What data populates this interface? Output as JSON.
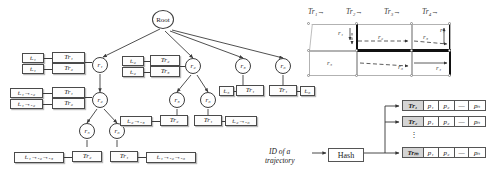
{
  "figure": {
    "panels": [
      "index-tree",
      "grid-trajectories",
      "hash-table"
    ]
  },
  "tree": {
    "root_label": "Root",
    "nodes": [
      {
        "id": "root",
        "label": "Root"
      },
      {
        "id": "r1",
        "label": "r₁"
      },
      {
        "id": "r2",
        "label": "r₂"
      },
      {
        "id": "r3",
        "label": "r₃"
      },
      {
        "id": "r4",
        "label": "r₆"
      },
      {
        "id": "r5",
        "label": "r₃"
      },
      {
        "id": "r6",
        "label": "r₆"
      },
      {
        "id": "r7",
        "label": "r₅"
      },
      {
        "id": "r8",
        "label": "r₆"
      }
    ],
    "boxes": [
      {
        "id": "b1",
        "text": "tᵣ₁"
      },
      {
        "id": "b2",
        "text": "Tr₁"
      },
      {
        "id": "b3",
        "text": "tᵣ₁"
      },
      {
        "id": "b4",
        "text": "Tr₂"
      },
      {
        "id": "b5",
        "text": "tᵣ₁→ᵣ₂"
      },
      {
        "id": "b6",
        "text": "Tr₁"
      },
      {
        "id": "b7",
        "text": "tᵣ₁→ᵣ₂"
      },
      {
        "id": "b8",
        "text": "Tr₂"
      },
      {
        "id": "b9",
        "text": "tᵣ₂"
      },
      {
        "id": "b10",
        "text": "Tr₂"
      },
      {
        "id": "b11",
        "text": "tᵣ₂"
      },
      {
        "id": "b12",
        "text": "Tr₃"
      },
      {
        "id": "b13",
        "text": "tᵣ₅"
      },
      {
        "id": "b14",
        "text": "Tr₁"
      },
      {
        "id": "b15",
        "text": "Tr₁"
      },
      {
        "id": "b16",
        "text": "tᵣ₆"
      },
      {
        "id": "b17",
        "text": "tᵣ₂→ᵣ₃"
      },
      {
        "id": "b18",
        "text": "Tr₂"
      },
      {
        "id": "b19",
        "text": "Tr₁"
      },
      {
        "id": "b20",
        "text": "tᵣ₂→ᵣ₆"
      },
      {
        "id": "b21",
        "text": "tᵣ₁→ᵣ₂→ᵣ₃"
      },
      {
        "id": "b22",
        "text": "Tr₂"
      },
      {
        "id": "b23",
        "text": "Tr₁"
      },
      {
        "id": "b24",
        "text": "tᵣ₁→ᵣ₂→ᵣ₆"
      }
    ]
  },
  "grid": {
    "column_headers": [
      "Tr₁",
      "Tr₂",
      "Tr₃",
      "Tr₄"
    ],
    "header_arrow": "→",
    "region_labels_top": [
      "r₁",
      "r₂",
      "r₃",
      "r₇"
    ],
    "region_labels_bottom": [
      "r₅",
      "r₆",
      "r₄"
    ]
  },
  "hash": {
    "input_line1": "ID of a",
    "input_line2": "trajectory",
    "function_label": "Hash",
    "vertical_ellipsis": "⋮",
    "rows": [
      {
        "key": "Tr₁",
        "cells": [
          "p₁",
          "p₂",
          "—",
          "pₙ"
        ]
      },
      {
        "key": "Tr₂",
        "cells": [
          "p₁",
          "p₂",
          "—",
          "pₙ"
        ]
      },
      {
        "key": "Trₘ",
        "cells": [
          "p₁",
          "p₂",
          "—",
          "pₙ"
        ]
      }
    ]
  },
  "colors": {
    "line": "#3c3c3c",
    "grid_cell_border": "#b2b2b2",
    "thick_edge": "#111111",
    "hash_key_fill": "#d4d4d4"
  }
}
